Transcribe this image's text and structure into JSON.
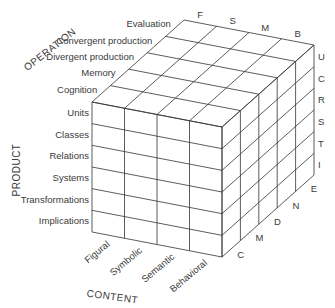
{
  "diagram": {
    "axes": {
      "operation": {
        "label": "OPERATION",
        "items": [
          "Evaluation",
          "Convergent production",
          "Divergent production",
          "Memory",
          "Cognition"
        ],
        "letters": [
          "E",
          "N",
          "D",
          "M",
          "C"
        ]
      },
      "product": {
        "label": "PRODUCT",
        "items": [
          "Units",
          "Classes",
          "Relations",
          "Systems",
          "Transformations",
          "Implications"
        ],
        "letters": [
          "U",
          "C",
          "R",
          "S",
          "T",
          "I"
        ]
      },
      "content": {
        "label": "CONTENT",
        "items": [
          "Figural",
          "Symbolic",
          "Semantic",
          "Behavioral"
        ],
        "letters": [
          "F",
          "S",
          "M",
          "B"
        ]
      }
    },
    "line_color": "#333333"
  }
}
